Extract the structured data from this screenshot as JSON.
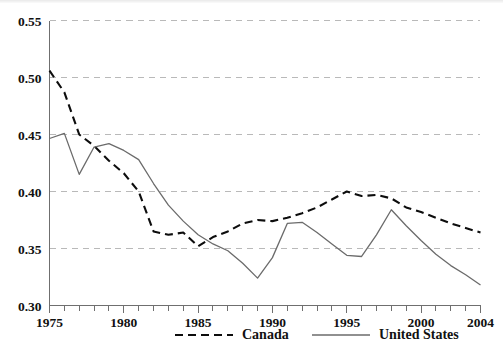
{
  "chart_data": {
    "type": "line",
    "title": "",
    "subtitle": "",
    "xlabel": "",
    "ylabel": "",
    "xlim": [
      1975,
      2004
    ],
    "ylim": [
      0.3,
      0.55
    ],
    "grid": true,
    "grid_axis": "y",
    "legend_position": "bottom",
    "x_tick_labels": [
      "1975",
      "1980",
      "1985",
      "1990",
      "1995",
      "2000",
      "2004"
    ],
    "x_tick_values": [
      1975,
      1980,
      1985,
      1990,
      1995,
      2000,
      2004
    ],
    "x_minor_tick_step": 1,
    "y_tick_labels": [
      "0.30",
      "0.35",
      "0.40",
      "0.45",
      "0.50",
      "0.55"
    ],
    "y_tick_values": [
      0.3,
      0.35,
      0.4,
      0.45,
      0.5,
      0.55
    ],
    "x": [
      1975,
      1976,
      1977,
      1978,
      1979,
      1980,
      1981,
      1982,
      1983,
      1984,
      1985,
      1986,
      1987,
      1988,
      1989,
      1990,
      1991,
      1992,
      1993,
      1994,
      1995,
      1996,
      1997,
      1998,
      1999,
      2000,
      2001,
      2002,
      2003,
      2004
    ],
    "series": [
      {
        "name": "Canada",
        "style": "dashed",
        "color": "#0d0d0d",
        "values": [
          0.506,
          0.487,
          0.45,
          0.44,
          0.427,
          0.416,
          0.4,
          0.365,
          0.362,
          0.364,
          0.352,
          0.36,
          0.365,
          0.372,
          0.375,
          0.374,
          0.377,
          0.381,
          0.386,
          0.393,
          0.4,
          0.396,
          0.397,
          0.394,
          0.386,
          0.382,
          0.377,
          0.372,
          0.368,
          0.364
        ]
      },
      {
        "name": "United States",
        "style": "solid",
        "color": "#6b6b6b",
        "values": [
          0.4465,
          0.451,
          0.415,
          0.439,
          0.442,
          0.436,
          0.428,
          0.407,
          0.388,
          0.374,
          0.362,
          0.354,
          0.348,
          0.337,
          0.324,
          0.342,
          0.372,
          0.373,
          0.364,
          0.354,
          0.344,
          0.343,
          0.362,
          0.384,
          0.37,
          0.357,
          0.345,
          0.335,
          0.327,
          0.318
        ]
      }
    ],
    "legend": [
      {
        "label": "Canada",
        "style": "dashed",
        "color": "#0d0d0d"
      },
      {
        "label": "United States",
        "style": "solid",
        "color": "#6b6b6b"
      }
    ]
  }
}
